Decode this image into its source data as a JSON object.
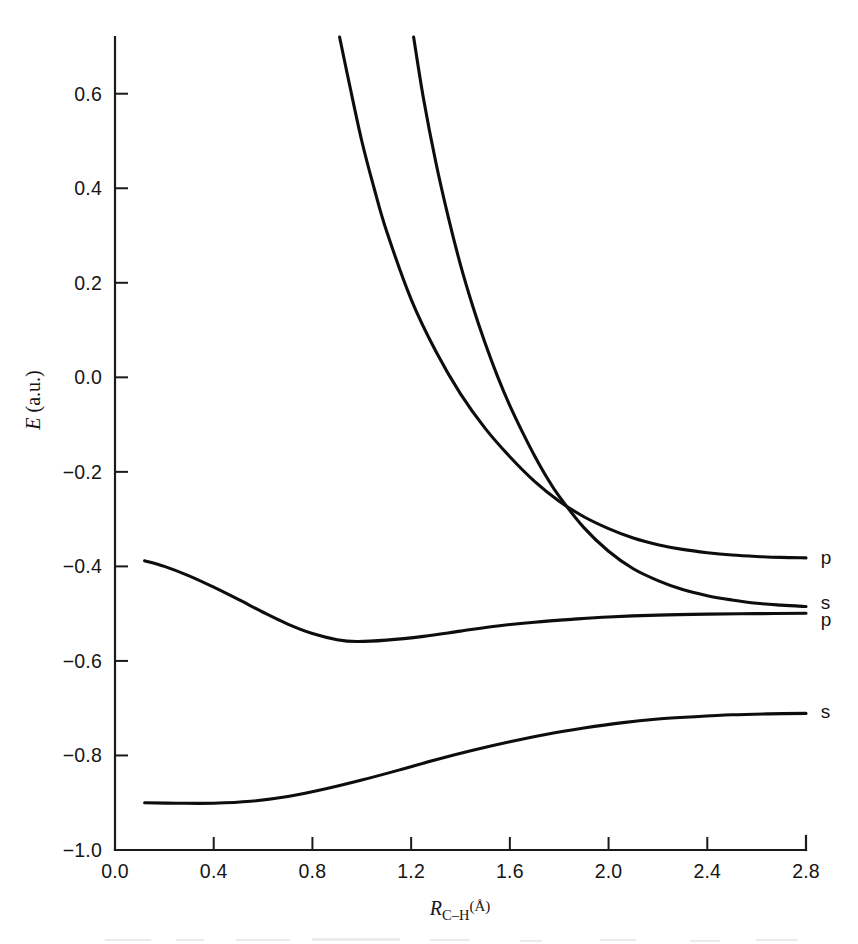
{
  "chart_data": {
    "type": "line",
    "title": "",
    "xlabel": "R_C-H (Å)",
    "ylabel": "E (a.u.)",
    "xlim": [
      0.0,
      2.8
    ],
    "ylim": [
      -1.0,
      0.72
    ],
    "grid": false,
    "legend_position": "right-endpoint-labels",
    "xticks": [
      "0.0",
      "0.4",
      "0.8",
      "1.2",
      "1.6",
      "2.0",
      "2.4",
      "2.8"
    ],
    "xtick_values": [
      0.0,
      0.4,
      0.8,
      1.2,
      1.6,
      2.0,
      2.4,
      2.8
    ],
    "yticks": [
      "0.6",
      "0.4",
      "0.2",
      "0.0",
      "−0.2",
      "−0.4",
      "−0.6",
      "−0.8",
      "−1.0"
    ],
    "ytick_values": [
      0.6,
      0.4,
      0.2,
      0.0,
      -0.2,
      -0.4,
      -0.6,
      -0.8,
      -1.0
    ],
    "series": [
      {
        "name": "repulsive-p",
        "label": "p",
        "label_energy": -0.38,
        "points": [
          [
            0.91,
            0.72
          ],
          [
            0.95,
            0.62
          ],
          [
            1.0,
            0.5
          ],
          [
            1.05,
            0.4
          ],
          [
            1.1,
            0.31
          ],
          [
            1.2,
            0.165
          ],
          [
            1.3,
            0.055
          ],
          [
            1.4,
            -0.035
          ],
          [
            1.5,
            -0.108
          ],
          [
            1.6,
            -0.168
          ],
          [
            1.7,
            -0.22
          ],
          [
            1.8,
            -0.262
          ],
          [
            1.9,
            -0.295
          ],
          [
            2.0,
            -0.32
          ],
          [
            2.1,
            -0.34
          ],
          [
            2.2,
            -0.354
          ],
          [
            2.3,
            -0.364
          ],
          [
            2.4,
            -0.371
          ],
          [
            2.5,
            -0.376
          ],
          [
            2.6,
            -0.379
          ],
          [
            2.7,
            -0.381
          ],
          [
            2.8,
            -0.382
          ]
        ]
      },
      {
        "name": "repulsive-s",
        "label": "s",
        "label_energy": -0.485,
        "points": [
          [
            1.21,
            0.72
          ],
          [
            1.25,
            0.59
          ],
          [
            1.3,
            0.455
          ],
          [
            1.35,
            0.34
          ],
          [
            1.4,
            0.238
          ],
          [
            1.45,
            0.15
          ],
          [
            1.5,
            0.072
          ],
          [
            1.55,
            0.002
          ],
          [
            1.6,
            -0.06
          ],
          [
            1.65,
            -0.115
          ],
          [
            1.7,
            -0.166
          ],
          [
            1.75,
            -0.212
          ],
          [
            1.8,
            -0.252
          ],
          [
            1.9,
            -0.318
          ],
          [
            2.0,
            -0.368
          ],
          [
            2.1,
            -0.405
          ],
          [
            2.2,
            -0.43
          ],
          [
            2.3,
            -0.449
          ],
          [
            2.4,
            -0.462
          ],
          [
            2.5,
            -0.471
          ],
          [
            2.6,
            -0.478
          ],
          [
            2.7,
            -0.482
          ],
          [
            2.8,
            -0.485
          ]
        ]
      },
      {
        "name": "bound-p",
        "label": "p",
        "label_energy": -0.5,
        "points": [
          [
            0.12,
            -0.388
          ],
          [
            0.2,
            -0.4
          ],
          [
            0.3,
            -0.42
          ],
          [
            0.4,
            -0.444
          ],
          [
            0.5,
            -0.47
          ],
          [
            0.6,
            -0.497
          ],
          [
            0.7,
            -0.522
          ],
          [
            0.8,
            -0.542
          ],
          [
            0.9,
            -0.555
          ],
          [
            0.98,
            -0.559
          ],
          [
            1.1,
            -0.556
          ],
          [
            1.25,
            -0.548
          ],
          [
            1.4,
            -0.537
          ],
          [
            1.55,
            -0.526
          ],
          [
            1.7,
            -0.518
          ],
          [
            1.85,
            -0.512
          ],
          [
            2.0,
            -0.507
          ],
          [
            2.2,
            -0.503
          ],
          [
            2.4,
            -0.501
          ],
          [
            2.6,
            -0.5
          ],
          [
            2.8,
            -0.499
          ]
        ]
      },
      {
        "name": "bound-s",
        "label": "s",
        "label_energy": -0.71,
        "points": [
          [
            0.12,
            -0.9
          ],
          [
            0.25,
            -0.901
          ],
          [
            0.4,
            -0.901
          ],
          [
            0.55,
            -0.897
          ],
          [
            0.7,
            -0.887
          ],
          [
            0.85,
            -0.871
          ],
          [
            1.0,
            -0.852
          ],
          [
            1.15,
            -0.831
          ],
          [
            1.3,
            -0.809
          ],
          [
            1.45,
            -0.789
          ],
          [
            1.6,
            -0.771
          ],
          [
            1.75,
            -0.755
          ],
          [
            1.9,
            -0.742
          ],
          [
            2.05,
            -0.731
          ],
          [
            2.2,
            -0.723
          ],
          [
            2.35,
            -0.718
          ],
          [
            2.5,
            -0.714
          ],
          [
            2.65,
            -0.712
          ],
          [
            2.8,
            -0.711
          ]
        ]
      }
    ],
    "annotations": [
      {
        "text": "p",
        "x": 2.86,
        "y": -0.38
      },
      {
        "text": "s",
        "x": 2.86,
        "y": -0.475
      },
      {
        "text": "p",
        "x": 2.86,
        "y": -0.512
      },
      {
        "text": "s",
        "x": 2.86,
        "y": -0.705
      }
    ]
  }
}
